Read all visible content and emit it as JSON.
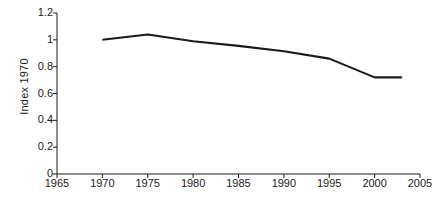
{
  "chart_data": {
    "type": "line",
    "title": "",
    "xlabel": "Year",
    "ylabel": "Index 1970",
    "xlim": [
      1965,
      2005
    ],
    "ylim": [
      0,
      1.2
    ],
    "grid": false,
    "legend": "none",
    "x_ticks": [
      "1965",
      "1970",
      "1975",
      "1980",
      "1985",
      "1990",
      "1995",
      "2000",
      "2005"
    ],
    "y_ticks": [
      "0",
      "0.2",
      "0.4",
      "0.6",
      "0.8",
      "1",
      "1.2"
    ],
    "x_tick_values": [
      1965,
      1970,
      1975,
      1980,
      1985,
      1990,
      1995,
      2000,
      2005
    ],
    "y_tick_values": [
      0,
      0.2,
      0.4,
      0.6,
      0.8,
      1,
      1.2
    ],
    "series": [
      {
        "name": "Index 1970",
        "color": "#1a1a1a",
        "x": [
          1970,
          1975,
          1980,
          1985,
          1990,
          1995,
          2000,
          2003
        ],
        "values": [
          1.0,
          1.04,
          0.99,
          0.955,
          0.915,
          0.86,
          0.72,
          0.72
        ]
      }
    ]
  },
  "axes": {
    "y_axis_title": "Index 1970",
    "x_axis_title": "Year"
  }
}
